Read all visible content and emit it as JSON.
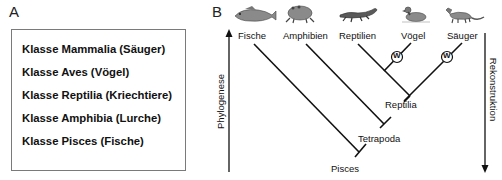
{
  "panel_a": {
    "letter": "A",
    "classes": [
      {
        "label": "Klasse Mammalia (Säuger)"
      },
      {
        "label": "Klasse Aves (Vögel)"
      },
      {
        "label": "Klasse Reptilia (Kriechtiere)"
      },
      {
        "label": "Klasse Amphibia (Lurche)"
      },
      {
        "label": "Klasse Pisces (Fische)"
      }
    ]
  },
  "panel_b": {
    "letter": "B",
    "taxa": [
      {
        "label": "Fische",
        "icon": "fish-icon"
      },
      {
        "label": "Amphibien",
        "icon": "frog-icon"
      },
      {
        "label": "Reptilien",
        "icon": "lizard-icon"
      },
      {
        "label": "Vögel",
        "icon": "duck-icon"
      },
      {
        "label": "Säuger",
        "icon": "mammal-icon"
      }
    ],
    "nodes": [
      {
        "label": "Reptilia"
      },
      {
        "label": "Tetrapoda"
      },
      {
        "label": "Pisces"
      }
    ],
    "markers": [
      {
        "label": "W"
      },
      {
        "label": "W"
      }
    ],
    "left_axis": {
      "label": "Phylogenese",
      "direction": "up"
    },
    "right_axis": {
      "label": "Rekonstruktion",
      "direction": "down"
    }
  }
}
